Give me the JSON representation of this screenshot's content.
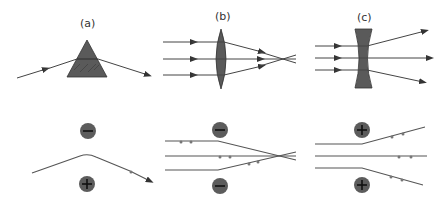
{
  "figure": {
    "panels": [
      {
        "id": "a",
        "label": "(a)",
        "optic": "prism",
        "charges": [
          "-",
          "+"
        ]
      },
      {
        "id": "b",
        "label": "(b)",
        "optic": "convex-lens",
        "charges": [
          "-",
          "-"
        ]
      },
      {
        "id": "c",
        "label": "(c)",
        "optic": "concave-lens",
        "charges": [
          "+",
          "+"
        ]
      }
    ],
    "colors": {
      "optic_fill": "#5a5a5a",
      "charge_fill": "#5c5c5c",
      "line": "#444444"
    }
  }
}
